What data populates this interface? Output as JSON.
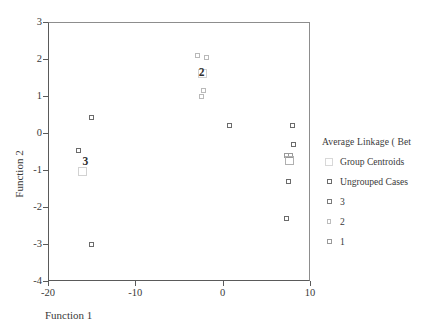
{
  "chart_data": {
    "type": "scatter",
    "title": "",
    "xlabel": "Function 1",
    "ylabel": "Function 2",
    "xlim": [
      -20,
      10
    ],
    "ylim": [
      -4,
      3
    ],
    "xticks": [
      "-20",
      "-10",
      "0",
      "10"
    ],
    "xtick_values": [
      -20,
      -10,
      0,
      10
    ],
    "yticks": [
      "3",
      "2",
      "1",
      "0",
      "-1",
      "-2",
      "-3",
      "-4"
    ],
    "ytick_values": [
      3,
      2,
      1,
      0,
      -1,
      -2,
      -3,
      -4
    ],
    "grid": false,
    "legend_position": "right",
    "legend_title": "Average Linkage  ( Bet",
    "series": [
      {
        "name": "Ungrouped Cases",
        "marker": "open-square",
        "points": [
          {
            "x": -16.5,
            "y": -0.48
          },
          {
            "x": -15.0,
            "y": 0.42
          },
          {
            "x": -15.0,
            "y": -3.0
          },
          {
            "x": 0.8,
            "y": 0.2
          },
          {
            "x": 8.0,
            "y": 0.2
          },
          {
            "x": 8.1,
            "y": -0.3
          },
          {
            "x": 7.5,
            "y": -1.3
          },
          {
            "x": 7.3,
            "y": -2.3
          }
        ]
      },
      {
        "name": "3",
        "marker": "open-square",
        "points": []
      },
      {
        "name": "2",
        "marker": "open-square",
        "points": [
          {
            "x": -2.9,
            "y": 2.1
          },
          {
            "x": -1.9,
            "y": 2.05
          },
          {
            "x": -2.15,
            "y": 1.15
          },
          {
            "x": -2.45,
            "y": 1.0
          }
        ]
      },
      {
        "name": "1",
        "marker": "open-square",
        "points": [
          {
            "x": 7.3,
            "y": -0.62
          },
          {
            "x": 7.8,
            "y": -0.6
          }
        ]
      },
      {
        "name": "Group Centroids",
        "marker": "large-open-square",
        "points": [
          {
            "x": -16.1,
            "y": -1.05,
            "label": "3"
          },
          {
            "x": -2.3,
            "y": 1.62,
            "label": "2"
          },
          {
            "x": 7.7,
            "y": -0.75,
            "label": "1"
          }
        ]
      }
    ],
    "group_labels": [
      {
        "text": "3",
        "x": -15.7,
        "y": -0.78
      },
      {
        "text": "2",
        "x": -2.4,
        "y": 1.62
      }
    ]
  },
  "legend": {
    "title": "Average Linkage  ( Bet",
    "items": [
      {
        "label": "Group Centroids",
        "key": "centroid-key-icon"
      },
      {
        "label": "Ungrouped Cases",
        "key": "ungrouped-key-icon"
      },
      {
        "label": "3",
        "key": "group3-key-icon"
      },
      {
        "label": "2",
        "key": "group2-key-icon"
      },
      {
        "label": "1",
        "key": "group1-key-icon"
      }
    ]
  },
  "axes": {
    "x_title": "Function 1",
    "y_title": "Function 2",
    "x_ticks": [
      "-20",
      "-10",
      "0",
      "10"
    ],
    "y_ticks": [
      "3",
      "2",
      "1",
      "0",
      "-1",
      "-2",
      "-3",
      "-4"
    ]
  }
}
